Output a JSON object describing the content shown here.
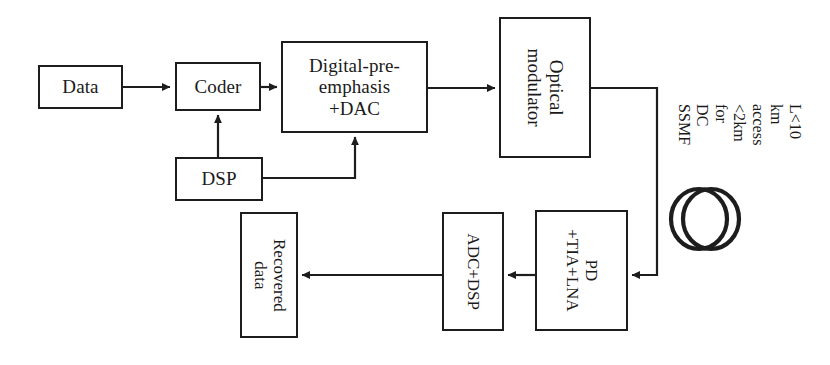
{
  "diagram": {
    "background_color": "#ffffff",
    "stroke_color": "#1d1d1d",
    "blocks": [
      {
        "id": "data",
        "label": "Data",
        "orientation": "horizontal"
      },
      {
        "id": "coder",
        "label": "Coder",
        "orientation": "horizontal"
      },
      {
        "id": "dpe_dac",
        "label": "Digital-pre-\nemphasis\n+DAC",
        "orientation": "horizontal"
      },
      {
        "id": "optical_mod",
        "label": "Optical\nmodulator",
        "orientation": "vertical"
      },
      {
        "id": "dsp",
        "label": "DSP",
        "orientation": "horizontal"
      },
      {
        "id": "pd_tia_lna",
        "label": "PD\n+TIA+LNA",
        "orientation": "vertical"
      },
      {
        "id": "adc_dsp",
        "label": "ADC+DSP",
        "orientation": "vertical"
      },
      {
        "id": "recovered",
        "label": "Recovered data",
        "orientation": "vertical"
      }
    ],
    "annotations": [
      {
        "id": "fiber-note",
        "text": "L<10 km access\n<2km for DC\nSSMF",
        "orientation": "vertical"
      }
    ],
    "fiber_coil": {
      "id": "fiber-spool",
      "description": "two overlapping circles representing a fiber spool"
    },
    "connections": [
      {
        "from": "data",
        "to": "coder",
        "kind": "arrow"
      },
      {
        "from": "coder",
        "to": "dpe_dac",
        "kind": "arrow"
      },
      {
        "from": "dpe_dac",
        "to": "optical_mod",
        "kind": "arrow"
      },
      {
        "from": "dsp",
        "to": "coder",
        "kind": "arrow"
      },
      {
        "from": "dsp",
        "to": "dpe_dac",
        "kind": "arrow"
      },
      {
        "from": "optical_mod",
        "to": "pd_tia_lna",
        "kind": "arrow-fiber"
      },
      {
        "from": "pd_tia_lna",
        "to": "adc_dsp",
        "kind": "arrow"
      },
      {
        "from": "adc_dsp",
        "to": "recovered",
        "kind": "arrow"
      }
    ]
  }
}
